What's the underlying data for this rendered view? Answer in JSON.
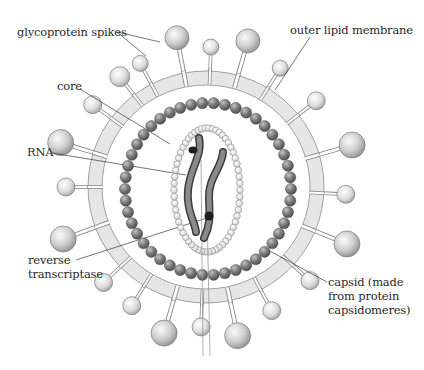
{
  "diagram": {
    "labels": {
      "glycoprotein_spikes": "glycoprotein spikes",
      "outer_lipid_membrane": "outer lipid membrane",
      "core": "core",
      "rna": "RNA",
      "reverse_transcriptase_line1": "reverse",
      "reverse_transcriptase_line2": "transcriptase",
      "capsid_line1": "capsid (made",
      "capsid_line2": "from protein",
      "capsid_line3": "capsidomeres)"
    },
    "colors": {
      "membrane_fill": "#e4e4e4",
      "membrane_stroke": "#8a8a8a",
      "capsid_bead": "#7a7a7a",
      "core_bead": "#f2f2f2",
      "rna": "#6e6e6e",
      "enzyme": "#1e1e1e",
      "spike_head": "#c8c8c8",
      "leader_line": "#333333"
    }
  }
}
